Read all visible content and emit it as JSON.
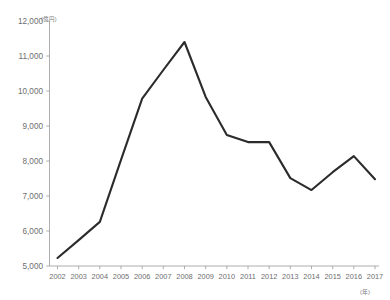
{
  "chart_data": {
    "type": "line",
    "title": "",
    "xlabel": "(年)",
    "ylabel": "(億円)",
    "ylim": [
      5000,
      12000
    ],
    "ytick_step": 1000,
    "grid": false,
    "legend": "none",
    "categories": [
      "2002",
      "2003",
      "2004",
      "2005",
      "2006",
      "2007",
      "2008",
      "2009",
      "2010",
      "2011",
      "2012",
      "2013",
      "2014",
      "2015",
      "2016",
      "2017"
    ],
    "ytick_labels": [
      "12,000",
      "11,000",
      "10,000",
      "9,000",
      "8,000",
      "7,000",
      "6,000",
      "5,000"
    ],
    "ytick_values": [
      12000,
      11000,
      10000,
      9000,
      8000,
      7000,
      6000,
      5000
    ],
    "series": [
      {
        "name": "",
        "color": "#2b2b2b",
        "values": [
          5230,
          5740,
          6260,
          8030,
          9780,
          10600,
          11400,
          9830,
          8740,
          8540,
          8540,
          7510,
          7170,
          7680,
          8140,
          7480
        ]
      }
    ]
  },
  "axes": {
    "y_unit_label": "(億円)",
    "x_unit_label": "(年)"
  }
}
